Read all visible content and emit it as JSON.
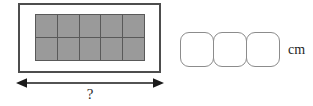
{
  "figure": {
    "type": "math-worksheet-diagram"
  },
  "shape": {
    "name": "tiled-rectangle",
    "frame_color": "#4d4d4d",
    "fill_color": "#ffffff",
    "grid": {
      "columns": 5,
      "rows": 2,
      "total_cells": 10,
      "cell_fill_color": "#9a9a9a",
      "cell_line_color": "#595959"
    }
  },
  "dimension": {
    "arrow_name": "double-headed-width-arrow",
    "arrow_color": "#1a1a1a",
    "label": "?"
  },
  "answer": {
    "boxes": [
      "",
      "",
      ""
    ],
    "box_count": 3,
    "box_border_color": "#8c8c8c",
    "unit": "cm",
    "placeholder": ""
  }
}
